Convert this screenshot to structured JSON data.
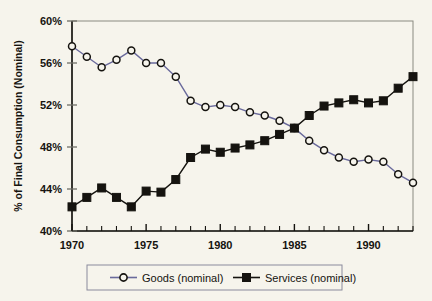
{
  "chart_data": {
    "type": "line",
    "title": "",
    "xlabel": "",
    "ylabel": "% of Final Consumption (Nominal)",
    "xlim": [
      1970,
      1993
    ],
    "ylim": [
      40,
      60
    ],
    "grid": false,
    "legend_position": "bottom",
    "x_tick_labels": [
      "1970",
      "1975",
      "1980",
      "1985",
      "1990"
    ],
    "x_tick_values": [
      1970,
      1975,
      1980,
      1985,
      1990
    ],
    "x_minor_ticks": [
      1970,
      1971,
      1972,
      1973,
      1974,
      1975,
      1976,
      1977,
      1978,
      1979,
      1980,
      1981,
      1982,
      1983,
      1984,
      1985,
      1986,
      1987,
      1988,
      1989,
      1990,
      1991,
      1992,
      1993
    ],
    "y_tick_labels": [
      "40%",
      "44%",
      "48%",
      "52%",
      "56%",
      "60%"
    ],
    "y_tick_values": [
      40,
      44,
      48,
      52,
      56,
      60
    ],
    "x": [
      1970,
      1971,
      1972,
      1973,
      1974,
      1975,
      1976,
      1977,
      1978,
      1979,
      1980,
      1981,
      1982,
      1983,
      1984,
      1985,
      1986,
      1987,
      1988,
      1989,
      1990,
      1991,
      1992,
      1993
    ],
    "series": [
      {
        "name": "Goods (nominal)",
        "marker": "open-circle",
        "color": "#6a6a9c",
        "marker_edge_color": "#15130f",
        "marker_face_color": "#f6f4ec",
        "values": [
          57.6,
          56.6,
          55.6,
          56.3,
          57.2,
          56.0,
          56.0,
          54.7,
          52.4,
          51.8,
          52.0,
          51.8,
          51.3,
          51.0,
          50.5,
          49.8,
          48.6,
          47.7,
          47.0,
          46.6,
          46.8,
          46.6,
          45.4,
          44.6
        ]
      },
      {
        "name": "Services (nominal)",
        "marker": "filled-square",
        "color": "#15130f",
        "marker_edge_color": "#15130f",
        "marker_face_color": "#15130f",
        "values": [
          42.3,
          43.2,
          44.1,
          43.2,
          42.3,
          43.8,
          43.7,
          44.9,
          47.0,
          47.8,
          47.5,
          47.9,
          48.2,
          48.6,
          49.2,
          49.8,
          51.0,
          51.9,
          52.2,
          52.5,
          52.2,
          52.4,
          53.6,
          54.7
        ]
      }
    ]
  },
  "legend": {
    "entries": [
      {
        "label": "Goods (nominal)"
      },
      {
        "label": "Services (nominal)"
      }
    ]
  },
  "colors": {
    "background": "#f6f4ec",
    "plot_border": "#8a8a80",
    "axis": "#15130f",
    "goods_line": "#6a6a9c",
    "services_line": "#15130f",
    "legend_border": "#8a8a9c"
  }
}
